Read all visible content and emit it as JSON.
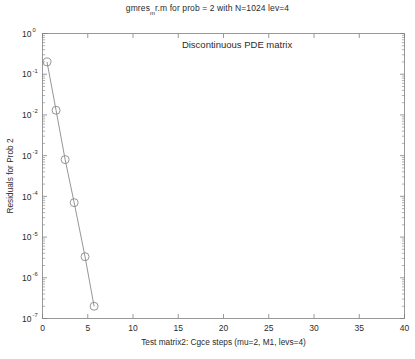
{
  "figure": {
    "title_prefix": "gmres",
    "title_sub": "m",
    "title_suffix": "r.m for prob = 2 with N=1024 lev=4",
    "background": "#ffffff",
    "axis_color": "#808080",
    "text_color": "#2b2b2b"
  },
  "chart_data": {
    "type": "line",
    "xlabel": "Test matrix2: Cgce steps (mu=2, M1, levs=4)",
    "ylabel": "Residuals for Prob 2",
    "xscale": "linear",
    "yscale": "log",
    "xlim": [
      0,
      40
    ],
    "ylim": [
      1e-07,
      1
    ],
    "grid": false,
    "legend": null,
    "annotations": [
      {
        "text": "Discontinuous PDE matrix",
        "x": 21.5,
        "y": 0.45
      }
    ],
    "xticks": [
      0,
      5,
      10,
      15,
      20,
      25,
      30,
      35,
      40
    ],
    "xtick_labels": [
      "0",
      "5",
      "10",
      "15",
      "20",
      "25",
      "30",
      "35",
      "40"
    ],
    "yticks": [
      1,
      0.1,
      0.01,
      0.001,
      0.0001,
      1e-05,
      1e-06,
      1e-07
    ],
    "ytick_labels": [
      "10^0",
      "10^-1",
      "10^-2",
      "10^-3",
      "10^-4",
      "10^-5",
      "10^-6",
      "10^-7"
    ],
    "ytick_mantissa": "10",
    "ytick_exponents": [
      "0",
      "-1",
      "-2",
      "-3",
      "-4",
      "-5",
      "-6",
      "-7"
    ],
    "series": [
      {
        "name": "Residual",
        "marker": "circle-open",
        "marker_size": 4,
        "line_color": "#8a8a8a",
        "marker_color": "#8a8a8a",
        "x": [
          0.5,
          1.5,
          2.5,
          3.5,
          4.7,
          5.7
        ],
        "y": [
          0.2,
          0.013,
          0.0008,
          7e-05,
          3.3e-06,
          2e-07
        ]
      }
    ]
  }
}
